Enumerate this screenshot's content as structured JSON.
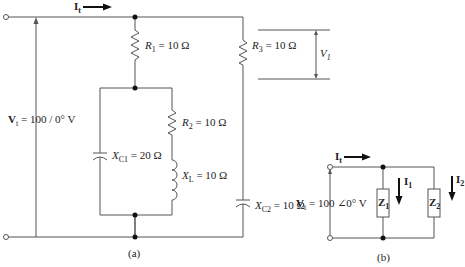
{
  "figure": {
    "panel_a": {
      "caption": "(a)",
      "source_label": "V",
      "source_sub": "t",
      "source_value": " = 100 / 0° V",
      "current_label": "I",
      "current_sub": "t",
      "components": [
        {
          "name": "R",
          "sub": "1",
          "value": " = 10 Ω"
        },
        {
          "name": "R",
          "sub": "2",
          "value": " = 10 Ω"
        },
        {
          "name": "R",
          "sub": "3",
          "value": " = 10 Ω"
        },
        {
          "name": "X",
          "sub": "C1",
          "value": " = 20 Ω"
        },
        {
          "name": "X",
          "sub": "L",
          "value": " = 10 Ω"
        },
        {
          "name": "X",
          "sub": "C2",
          "value": " = 10 Ω"
        }
      ],
      "voltage_marker": {
        "name": "V",
        "sub": "1"
      }
    },
    "panel_b": {
      "caption": "(b)",
      "source_label": "V",
      "source_sub": "t",
      "source_value": " = 100 ∠0° V",
      "current_label": "I",
      "current_sub": "t",
      "branches": [
        {
          "impedance": "Z",
          "sub": "1",
          "current": "I",
          "current_sub": "1"
        },
        {
          "impedance": "Z",
          "sub": "2",
          "current": "I",
          "current_sub": "2"
        }
      ]
    },
    "colors": {
      "wire": "#555555",
      "node": "#111111",
      "text": "#222222"
    }
  }
}
